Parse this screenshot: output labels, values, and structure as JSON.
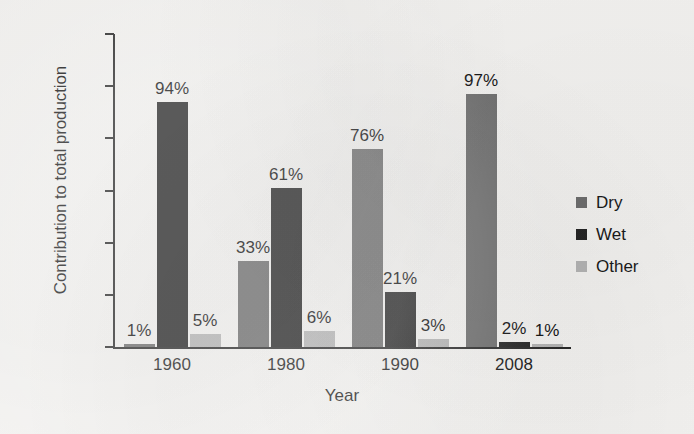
{
  "chart_data": {
    "type": "bar",
    "title": "",
    "subtitle": "",
    "xlabel": "Year",
    "ylabel": "Contribution to total production",
    "categories": [
      "1960",
      "1980",
      "1990",
      "2008"
    ],
    "series": [
      {
        "name": "Dry",
        "color": "#6e6e6e",
        "values": [
          1,
          33,
          76,
          97
        ]
      },
      {
        "name": "Wet",
        "color": "#262626",
        "values": [
          94,
          61,
          21,
          2
        ]
      },
      {
        "name": "Other",
        "color": "#b5b5b5",
        "values": [
          5,
          6,
          3,
          1
        ]
      }
    ],
    "value_labels": [
      [
        "1%",
        "94%",
        "5%"
      ],
      [
        "33%",
        "61%",
        "6%"
      ],
      [
        "76%",
        "21%",
        "3%"
      ],
      [
        "97%",
        "2%",
        "1%"
      ]
    ],
    "ylim": [
      0,
      120
    ],
    "yticks": [
      0,
      20,
      40,
      60,
      80,
      100,
      120
    ],
    "ytick_labels": [
      "0%",
      "20%",
      "40%",
      "60%",
      "80%",
      "100%",
      "120%"
    ],
    "grid": false,
    "legend_position": "right",
    "background_color": "#f4f3f1",
    "axis_color": "#2a2a2a"
  },
  "axes": {
    "y_title": "Contribution to total production",
    "x_title": "Year",
    "y_labels": [
      "120%",
      "100%",
      "80%",
      "60%",
      "40%",
      "20%",
      "0%"
    ],
    "x_labels": [
      "1960",
      "1980",
      "1990",
      "2008"
    ]
  },
  "legend": {
    "items": [
      {
        "label": "Dry",
        "color": "#6e6e6e"
      },
      {
        "label": "Wet",
        "color": "#262626"
      },
      {
        "label": "Other",
        "color": "#b5b5b5"
      }
    ]
  },
  "bars": {
    "g0": {
      "s0": {
        "label": "1%",
        "value": 1
      },
      "s1": {
        "label": "94%",
        "value": 94
      },
      "s2": {
        "label": "5%",
        "value": 5
      }
    },
    "g1": {
      "s0": {
        "label": "33%",
        "value": 33
      },
      "s1": {
        "label": "61%",
        "value": 61
      },
      "s2": {
        "label": "6%",
        "value": 6
      }
    },
    "g2": {
      "s0": {
        "label": "76%",
        "value": 76
      },
      "s1": {
        "label": "21%",
        "value": 21
      },
      "s2": {
        "label": "3%",
        "value": 3
      }
    },
    "g3": {
      "s0": {
        "label": "97%",
        "value": 97
      },
      "s1": {
        "label": "2%",
        "value": 2
      },
      "s2": {
        "label": "1%",
        "value": 1
      }
    }
  }
}
